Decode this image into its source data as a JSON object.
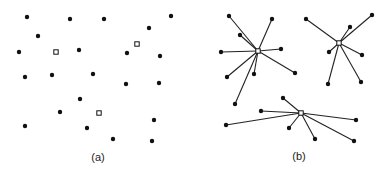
{
  "figure": {
    "colors": {
      "point": "#111111",
      "edge": "#222222",
      "center_fill": "#ffffff",
      "background": "#ffffff"
    },
    "panel_a": {
      "label": "(a)",
      "label_pos": [
        98,
        152
      ],
      "points": [
        [
          27,
          17
        ],
        [
          70,
          19
        ],
        [
          104,
          19
        ],
        [
          171,
          16
        ],
        [
          38,
          36
        ],
        [
          149,
          28
        ],
        [
          19,
          52
        ],
        [
          79,
          50
        ],
        [
          127,
          53
        ],
        [
          160,
          56
        ],
        [
          25,
          77
        ],
        [
          52,
          75
        ],
        [
          93,
          74
        ],
        [
          126,
          84
        ],
        [
          159,
          83
        ],
        [
          80,
          99
        ],
        [
          60,
          112
        ],
        [
          25,
          126
        ],
        [
          87,
          128
        ],
        [
          154,
          120
        ],
        [
          113,
          139
        ],
        [
          152,
          141
        ]
      ],
      "centers": [
        [
          56,
          52
        ],
        [
          137,
          44
        ],
        [
          99,
          113
        ]
      ]
    },
    "panel_b": {
      "label": "(b)",
      "label_pos": [
        299,
        151
      ],
      "clusters": [
        {
          "center": [
            258,
            51
          ],
          "points": [
            [
              229,
              16
            ],
            [
              272,
              19
            ],
            [
              240,
              35
            ],
            [
              221,
              52
            ],
            [
              281,
              49
            ],
            [
              295,
              73
            ],
            [
              227,
              77
            ],
            [
              254,
              74
            ],
            [
              235,
              104
            ]
          ]
        },
        {
          "center": [
            339,
            43
          ],
          "points": [
            [
              306,
              19
            ],
            [
              372,
              15
            ],
            [
              350,
              27
            ],
            [
              329,
              52
            ],
            [
              362,
              55
            ],
            [
              328,
              84
            ],
            [
              361,
              82
            ]
          ]
        },
        {
          "center": [
            301,
            113
          ],
          "points": [
            [
              283,
              98
            ],
            [
              261,
              111
            ],
            [
              226,
              125
            ],
            [
              289,
              128
            ],
            [
              315,
              139
            ],
            [
              356,
              120
            ],
            [
              354,
              141
            ]
          ]
        }
      ]
    }
  }
}
